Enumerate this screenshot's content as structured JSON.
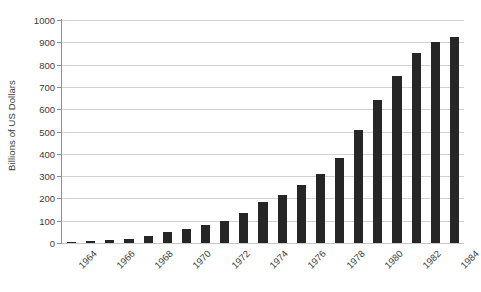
{
  "chart_data": {
    "type": "bar",
    "title": "",
    "xlabel": "",
    "ylabel": "Billions of US Dollars",
    "ylim": [
      0,
      1000
    ],
    "ytick_step": 100,
    "yticks": [
      0,
      100,
      200,
      300,
      400,
      500,
      600,
      700,
      800,
      900,
      1000
    ],
    "ytick_labels": [
      "0",
      "100",
      "200",
      "300",
      "400",
      "500",
      "600",
      "700",
      "800",
      "900",
      "1000"
    ],
    "grid": true,
    "legend": null,
    "bar_color": "#262626",
    "gridline_color": "#d2d2d2",
    "axis_color": "#8f8f8f",
    "text_color": "#3b3b3b",
    "categories": [
      "1964",
      "1965",
      "1966",
      "1967",
      "1968",
      "1969",
      "1970",
      "1971",
      "1972",
      "1973",
      "1974",
      "1975",
      "1976",
      "1977",
      "1978",
      "1979",
      "1980",
      "1981",
      "1982",
      "1983",
      "1984"
    ],
    "visible_xtick_labels": [
      "1964",
      "1966",
      "1968",
      "1970",
      "1972",
      "1974",
      "1976",
      "1978",
      "1980",
      "1982",
      "1984"
    ],
    "values": [
      5,
      10,
      13,
      20,
      30,
      50,
      62,
      82,
      100,
      135,
      185,
      215,
      260,
      310,
      380,
      505,
      640,
      750,
      850,
      900,
      925
    ]
  }
}
